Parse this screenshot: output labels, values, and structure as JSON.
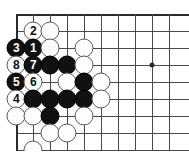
{
  "diagram": {
    "name": "go-board-diagram",
    "type": "go-problem-sequence",
    "board": {
      "columns": 10,
      "rows": 9,
      "origin_x": 16,
      "origin_y": 14,
      "spacing_x": 17,
      "spacing_y": 17,
      "edges": [
        "left",
        "top"
      ],
      "line_color": "#4a4a4a",
      "edge_color": "#2b2b2b",
      "background_color": "#ffffff"
    },
    "star_points": [
      {
        "name": "star-point-hoshi",
        "col": 9,
        "row": 4
      }
    ],
    "colors": {
      "black_stone": "#111111",
      "white_stone": "#fdfdfd",
      "white_stone_border": "#5a5a5a",
      "black_label": "#ffffff",
      "white_label": "#111111"
    },
    "stones": [
      {
        "name": "stone-white-move-2",
        "col": 2,
        "row": 2,
        "color": "white",
        "label": "2"
      },
      {
        "name": "stone-white-c3r2",
        "col": 3,
        "row": 2,
        "color": "white",
        "label": ""
      },
      {
        "name": "stone-black-move-3",
        "col": 1,
        "row": 3,
        "color": "black",
        "label": "3"
      },
      {
        "name": "stone-black-move-1",
        "col": 2,
        "row": 3,
        "color": "black",
        "label": "1"
      },
      {
        "name": "stone-white-c3r3",
        "col": 3,
        "row": 3,
        "color": "white",
        "label": ""
      },
      {
        "name": "stone-white-c5r3",
        "col": 5,
        "row": 3,
        "color": "white",
        "label": ""
      },
      {
        "name": "stone-white-move-8",
        "col": 1,
        "row": 4,
        "color": "white",
        "label": "8"
      },
      {
        "name": "stone-black-move-7",
        "col": 2,
        "row": 4,
        "color": "black",
        "label": "7"
      },
      {
        "name": "stone-black-c3r4",
        "col": 3,
        "row": 4,
        "color": "black",
        "label": ""
      },
      {
        "name": "stone-black-c4r4",
        "col": 4,
        "row": 4,
        "color": "black",
        "label": ""
      },
      {
        "name": "stone-white-c5r4",
        "col": 5,
        "row": 4,
        "color": "white",
        "label": ""
      },
      {
        "name": "stone-black-move-5",
        "col": 1,
        "row": 5,
        "color": "black",
        "label": "5"
      },
      {
        "name": "stone-white-move-6",
        "col": 2,
        "row": 5,
        "color": "white",
        "label": "6"
      },
      {
        "name": "stone-white-c4r5",
        "col": 4,
        "row": 5,
        "color": "white",
        "label": ""
      },
      {
        "name": "stone-black-c5r5",
        "col": 5,
        "row": 5,
        "color": "black",
        "label": ""
      },
      {
        "name": "stone-white-c6r5",
        "col": 6,
        "row": 5,
        "color": "white",
        "label": ""
      },
      {
        "name": "stone-white-move-4",
        "col": 1,
        "row": 6,
        "color": "white",
        "label": "4"
      },
      {
        "name": "stone-black-c2r6",
        "col": 2,
        "row": 6,
        "color": "black",
        "label": ""
      },
      {
        "name": "stone-black-c3r6",
        "col": 3,
        "row": 6,
        "color": "black",
        "label": ""
      },
      {
        "name": "stone-black-c4r6",
        "col": 4,
        "row": 6,
        "color": "black",
        "label": ""
      },
      {
        "name": "stone-black-c5r6",
        "col": 5,
        "row": 6,
        "color": "black",
        "label": ""
      },
      {
        "name": "stone-white-c6r6",
        "col": 6,
        "row": 6,
        "color": "white",
        "label": ""
      },
      {
        "name": "stone-white-c1r7",
        "col": 1,
        "row": 7,
        "color": "white",
        "label": ""
      },
      {
        "name": "stone-white-c2r7",
        "col": 2,
        "row": 7,
        "color": "white",
        "label": ""
      },
      {
        "name": "stone-black-c3r7",
        "col": 3,
        "row": 7,
        "color": "black",
        "label": ""
      },
      {
        "name": "stone-white-c5r7",
        "col": 5,
        "row": 7,
        "color": "white",
        "label": ""
      },
      {
        "name": "stone-white-c3r8",
        "col": 3,
        "row": 8,
        "color": "white",
        "label": ""
      },
      {
        "name": "stone-white-c4r8",
        "col": 4,
        "row": 8,
        "color": "white",
        "label": ""
      },
      {
        "name": "stone-white-c2r9",
        "col": 2,
        "row": 9,
        "color": "white",
        "label": ""
      }
    ],
    "move_sequence": [
      {
        "move": 1,
        "color": "black"
      },
      {
        "move": 2,
        "color": "white"
      },
      {
        "move": 3,
        "color": "black"
      },
      {
        "move": 4,
        "color": "white"
      },
      {
        "move": 5,
        "color": "black"
      },
      {
        "move": 6,
        "color": "white"
      },
      {
        "move": 7,
        "color": "black"
      },
      {
        "move": 8,
        "color": "white"
      }
    ]
  }
}
